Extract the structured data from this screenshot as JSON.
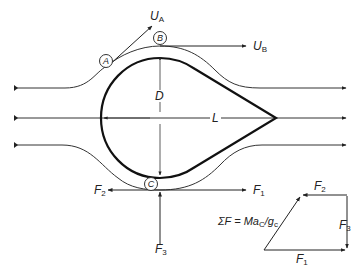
{
  "diagram": {
    "dimensions": {
      "diameter_label": "D",
      "length_label": "L"
    },
    "points": {
      "A": "A",
      "B": "B",
      "C": "C"
    },
    "velocities": {
      "UA": {
        "symbol": "U",
        "sub": "A"
      },
      "UB": {
        "symbol": "U",
        "sub": "B"
      }
    },
    "forces": {
      "F1": {
        "symbol": "F",
        "sub": "1"
      },
      "F2": {
        "symbol": "F",
        "sub": "2"
      },
      "F3": {
        "symbol": "F",
        "sub": "3"
      }
    },
    "polygon": {
      "F1": {
        "symbol": "F",
        "sub": "1"
      },
      "F2": {
        "symbol": "F",
        "sub": "2"
      },
      "F3": {
        "symbol": "F",
        "sub": "3"
      },
      "equation": {
        "lhs": "ΣF = Ma",
        "sub1": "C",
        "mid": "/g",
        "sub2": "c"
      }
    },
    "colors": {
      "line": "#222222",
      "body": "#111111",
      "background": "#ffffff"
    }
  }
}
